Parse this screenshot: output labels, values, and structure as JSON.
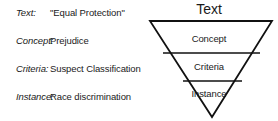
{
  "figure": {
    "title": "Text",
    "legend_rows": [
      {
        "label": "Text:",
        "value": "\"Equal Protection\""
      },
      {
        "label": "Concept:",
        "value": "Prejudice"
      },
      {
        "label": "Criteria:",
        "value": "Suspect Classification"
      },
      {
        "label": "Instance:",
        "value": "Race discrimination"
      }
    ],
    "funnel": {
      "apex_label": "Text",
      "bands": [
        {
          "label": "Concept"
        },
        {
          "label": "Criteria"
        },
        {
          "label": "Instance"
        }
      ]
    },
    "colors": {
      "background": "#ffffff",
      "stroke": "#111111",
      "text": "#1a1a1a"
    }
  }
}
